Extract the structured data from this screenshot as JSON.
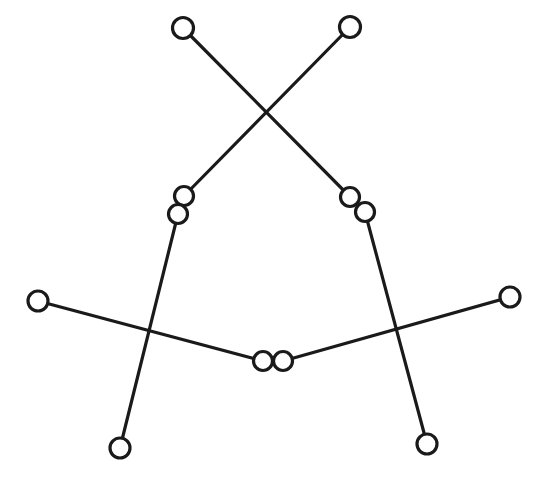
{
  "canvas": {
    "width": 543,
    "height": 484,
    "background_color": "#ffffff",
    "stroke_color": "#1a1a1a",
    "node_fill_color": "#ffffff",
    "line_width": 3.2
  },
  "diagram": {
    "type": "node-link-diagram",
    "node_count": 12,
    "edge_count": 6,
    "nodes": [
      {
        "id": "n1",
        "name": "top-left-node",
        "cx": 183,
        "cy": 28,
        "r": 10.5
      },
      {
        "id": "n2",
        "name": "top-right-node",
        "cx": 350,
        "cy": 27,
        "r": 10.5
      },
      {
        "id": "n3",
        "name": "mid-left-upper-node",
        "cx": 184,
        "cy": 196,
        "r": 9.5
      },
      {
        "id": "n4",
        "name": "mid-left-lower-node",
        "cx": 178,
        "cy": 214,
        "r": 9.5
      },
      {
        "id": "n5",
        "name": "mid-right-upper-node",
        "cx": 350,
        "cy": 197,
        "r": 9.5
      },
      {
        "id": "n6",
        "name": "mid-right-lower-node",
        "cx": 365,
        "cy": 212,
        "r": 9.5
      },
      {
        "id": "n7",
        "name": "far-left-node",
        "cx": 38,
        "cy": 301,
        "r": 10.0
      },
      {
        "id": "n8",
        "name": "far-right-node",
        "cx": 510,
        "cy": 297,
        "r": 10.0
      },
      {
        "id": "n9",
        "name": "center-left-node",
        "cx": 263,
        "cy": 361,
        "r": 9.5
      },
      {
        "id": "n10",
        "name": "center-right-node",
        "cx": 283,
        "cy": 361,
        "r": 9.5
      },
      {
        "id": "n11",
        "name": "bottom-left-node",
        "cx": 120,
        "cy": 448,
        "r": 10.0
      },
      {
        "id": "n12",
        "name": "bottom-right-node",
        "cx": 427,
        "cy": 444,
        "r": 10.0
      }
    ],
    "edges": [
      {
        "id": "e1",
        "name": "edge-topleft-to-midrightlower",
        "from": "n1",
        "to": "n6",
        "x1": 183,
        "y1": 28,
        "x2": 365,
        "y2": 212
      },
      {
        "id": "e2",
        "name": "edge-topright-to-midleftupper",
        "from": "n2",
        "to": "n3",
        "x1": 350,
        "y1": 27,
        "x2": 184,
        "y2": 196
      },
      {
        "id": "e3",
        "name": "edge-midleftlower-to-bottomleft",
        "from": "n4",
        "to": "n11",
        "x1": 178,
        "y1": 214,
        "x2": 120,
        "y2": 448
      },
      {
        "id": "e4",
        "name": "edge-midrightlower-to-bottomright",
        "from": "n6",
        "to": "n12",
        "x1": 365,
        "y1": 212,
        "x2": 427,
        "y2": 444
      },
      {
        "id": "e5",
        "name": "edge-farleft-to-centerleft",
        "from": "n7",
        "to": "n9",
        "x1": 38,
        "y1": 301,
        "x2": 263,
        "y2": 361
      },
      {
        "id": "e6",
        "name": "edge-farright-to-centerright",
        "from": "n8",
        "to": "n10",
        "x1": 510,
        "y1": 297,
        "x2": 283,
        "y2": 361
      }
    ]
  }
}
